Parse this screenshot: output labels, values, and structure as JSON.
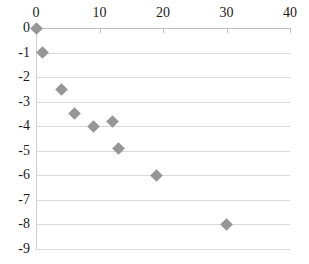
{
  "chart_data": {
    "type": "scatter",
    "title": "",
    "subtitle": "",
    "xlabel": "",
    "ylabel": "",
    "xlim": [
      0,
      40
    ],
    "ylim": [
      -9,
      0
    ],
    "x_axis_position": "top",
    "y_axis_direction": "descending",
    "grid": true,
    "grid_axis": "y",
    "legend": false,
    "legend_position": "none",
    "marker_shape": "diamond",
    "marker_color": "#969696",
    "gridline_color": "#d9d9d9",
    "axis_color": "#bfbfbf",
    "text_color": "#1a1a1a",
    "xticks": [
      0,
      10,
      20,
      30,
      40
    ],
    "xtick_labels": [
      "0",
      "10",
      "20",
      "30",
      "40"
    ],
    "yticks": [
      0,
      -1,
      -2,
      -3,
      -4,
      -5,
      -6,
      -7,
      -8,
      -9
    ],
    "ytick_labels": [
      "0",
      "-1",
      "-2",
      "-3",
      "-4",
      "-5",
      "-6",
      "-7",
      "-8",
      "-9"
    ],
    "series": [
      {
        "name": "series-1",
        "points": [
          {
            "x": 0,
            "y": 0
          },
          {
            "x": 1,
            "y": -1
          },
          {
            "x": 4,
            "y": -2.5
          },
          {
            "x": 6,
            "y": -3.5
          },
          {
            "x": 9,
            "y": -4
          },
          {
            "x": 12,
            "y": -3.8
          },
          {
            "x": 13,
            "y": -4.9
          },
          {
            "x": 19,
            "y": -6
          },
          {
            "x": 30,
            "y": -8
          }
        ]
      }
    ]
  }
}
